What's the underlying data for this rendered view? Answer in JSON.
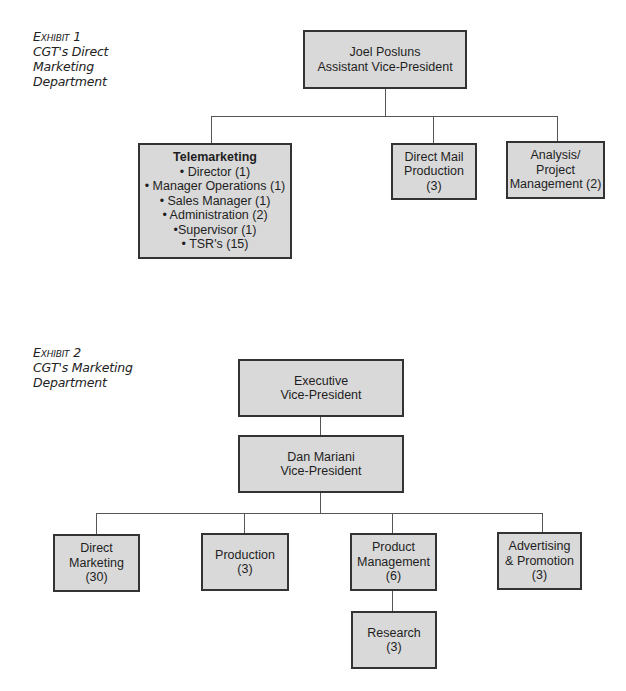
{
  "exhibit1": {
    "caption": {
      "label": "Exhibit 1",
      "title_lines": [
        "CGT's Direct",
        "Marketing",
        "Department"
      ]
    },
    "root": {
      "lines": [
        "Joel Posluns",
        "Assistant Vice-President"
      ]
    },
    "children": [
      {
        "id": "telemarketing",
        "title": "Telemarketing",
        "lines": [
          "• Director (1)",
          "• Manager Operations (1)",
          "• Sales Manager (1)",
          "• Administration (2)",
          "•Supervisor (1)",
          "• TSR's (15)"
        ]
      },
      {
        "id": "direct-mail-production",
        "lines": [
          "Direct Mail",
          "Production",
          "(3)"
        ]
      },
      {
        "id": "analysis-project-management",
        "lines": [
          "Analysis/",
          "Project",
          "Management (2)"
        ]
      }
    ]
  },
  "exhibit2": {
    "caption": {
      "label": "Exhibit 2",
      "title_lines": [
        "CGT's Marketing",
        "Department"
      ]
    },
    "top": {
      "lines": [
        "Executive",
        "Vice-President"
      ]
    },
    "root": {
      "lines": [
        "Dan Mariani",
        "Vice-President"
      ]
    },
    "children": [
      {
        "id": "direct-marketing",
        "lines": [
          "Direct",
          "Marketing",
          "(30)"
        ]
      },
      {
        "id": "production",
        "lines": [
          "Production",
          "(3)"
        ]
      },
      {
        "id": "product-management",
        "lines": [
          "Product",
          "Management",
          "(6)"
        ]
      },
      {
        "id": "advertising-promotion",
        "lines": [
          "Advertising",
          "& Promotion",
          "(3)"
        ]
      }
    ],
    "sub_child": {
      "id": "research",
      "lines": [
        "Research",
        "(3)"
      ]
    }
  },
  "colors": {
    "box_fill": "#d9d9d9",
    "box_border": "#333333",
    "connector": "#555555"
  }
}
